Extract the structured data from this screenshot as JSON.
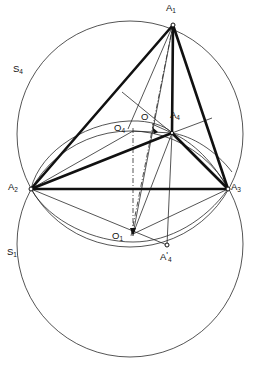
{
  "figure": {
    "type": "geometry-diagram",
    "width": 253,
    "height": 367,
    "background_color": "#ffffff",
    "stroke_color": "#1a1a1a"
  },
  "labels": {
    "vertex_a1": "A",
    "vertex_a1_sub": "1",
    "vertex_a2": "A",
    "vertex_a2_sub": "2",
    "vertex_a3": "A",
    "vertex_a3_sub": "3",
    "vertex_a4": "A",
    "vertex_a4_sub": "4",
    "vertex_a4prime": "A",
    "vertex_a4prime_sub": "4",
    "vertex_a4prime_mark": "'",
    "center_o": "O",
    "center_o4": "O",
    "center_o4_sub": "4",
    "center_o1": "O",
    "center_o1_sub": "1",
    "circle_s4": "S",
    "circle_s4_sub": "4",
    "circle_s1": "S",
    "circle_s1_sub": "1"
  },
  "points": [
    {
      "name": "A1",
      "x": 173,
      "y": 25,
      "marker": "open-circle"
    },
    {
      "name": "A2",
      "x": 31,
      "y": 189,
      "marker": "open-circle"
    },
    {
      "name": "A3",
      "x": 228,
      "y": 189,
      "marker": "open-circle"
    },
    {
      "name": "A4",
      "x": 172,
      "y": 133,
      "marker": "open-circle"
    },
    {
      "name": "A4prime",
      "x": 167,
      "y": 245,
      "marker": "open-circle"
    },
    {
      "name": "O",
      "x": 155,
      "y": 130,
      "marker": "none"
    },
    {
      "name": "O4",
      "x": 133,
      "y": 131,
      "marker": "none"
    },
    {
      "name": "O1",
      "x": 133,
      "y": 234,
      "marker": "none"
    }
  ],
  "circles": [
    {
      "name": "S4",
      "cx": 130,
      "cy": 134,
      "r": 113,
      "style": "thin"
    },
    {
      "name": "S1",
      "cx": 130,
      "cy": 244,
      "r": 113,
      "style": "thin"
    }
  ],
  "label_positions": {
    "A1": {
      "x": 166,
      "y": 4
    },
    "A2": {
      "x": 9,
      "y": 183
    },
    "A3": {
      "x": 231,
      "y": 183
    },
    "A4": {
      "x": 170,
      "y": 111
    },
    "A4prime": {
      "x": 160,
      "y": 253
    },
    "O": {
      "x": 141,
      "y": 113
    },
    "O4": {
      "x": 114,
      "y": 124
    },
    "O1": {
      "x": 113,
      "y": 232
    },
    "S4": {
      "x": 13,
      "y": 66
    },
    "S1": {
      "x": 7,
      "y": 248
    }
  },
  "edges": {
    "thick": [
      {
        "from": "A1",
        "to": "A2"
      },
      {
        "from": "A1",
        "to": "A3"
      },
      {
        "from": "A2",
        "to": "A3"
      },
      {
        "from": "A1",
        "to": "A4"
      },
      {
        "from": "A2",
        "to": "A4"
      },
      {
        "from": "A3",
        "to": "A4"
      }
    ],
    "thin": [
      {
        "from": "A1",
        "to": "O1"
      },
      {
        "from": "A4",
        "to": "O1"
      },
      {
        "from": "A2",
        "to": "A4prime"
      },
      {
        "from": "A4",
        "to": "A4prime"
      },
      {
        "from": "A1",
        "to": "O4"
      },
      {
        "from": "A4",
        "to": "upper-left-ray"
      },
      {
        "from": "A4",
        "to": "upper-right-ray"
      }
    ],
    "dashed": [
      {
        "from": "A1",
        "to": "O1",
        "note": "axis dash-dot"
      },
      {
        "from": "O4",
        "to": "O1",
        "note": "vertical dash-dot"
      }
    ]
  },
  "arcs": [
    {
      "name": "arc-A2-A4",
      "note": "ellipse arc from A2 through O4 to A4"
    },
    {
      "name": "arc-A4-A3",
      "note": "ellipse arc from A4 down to A3"
    },
    {
      "name": "arc-A2-A3-lower",
      "note": "lower ellipse arc through O1 region"
    }
  ]
}
